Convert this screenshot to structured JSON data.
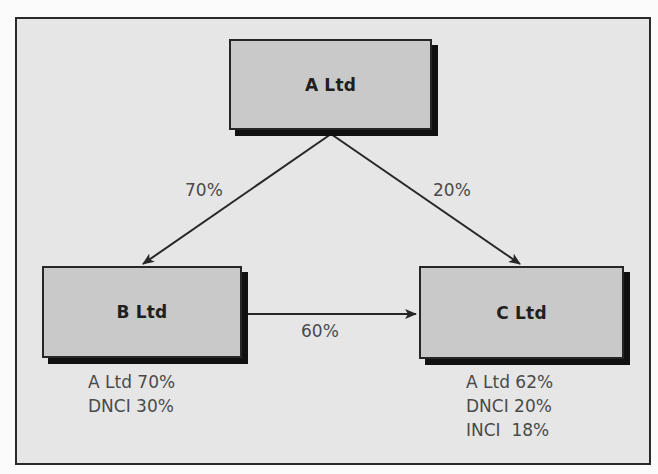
{
  "diagram": {
    "type": "group-ownership-structure",
    "colors": {
      "frame_background": "#e6e6e6",
      "node_fill": "#c9c9c9",
      "border": "#262626",
      "shadow": "#111111",
      "text": "#1f1f1f",
      "label_text": "#4a4a4a"
    },
    "nodes": {
      "a": {
        "label": "A Ltd"
      },
      "b": {
        "label": "B Ltd",
        "ownership": [
          "A Ltd 70%",
          "DNCI 30%"
        ]
      },
      "c": {
        "label": "C Ltd",
        "ownership": [
          "A Ltd 62%",
          "DNCI 20%",
          "INCI  18%"
        ]
      }
    },
    "edges": [
      {
        "from": "A Ltd",
        "to": "B Ltd",
        "label": "70%"
      },
      {
        "from": "A Ltd",
        "to": "C Ltd",
        "label": "20%"
      },
      {
        "from": "B Ltd",
        "to": "C Ltd",
        "label": "60%"
      }
    ]
  }
}
